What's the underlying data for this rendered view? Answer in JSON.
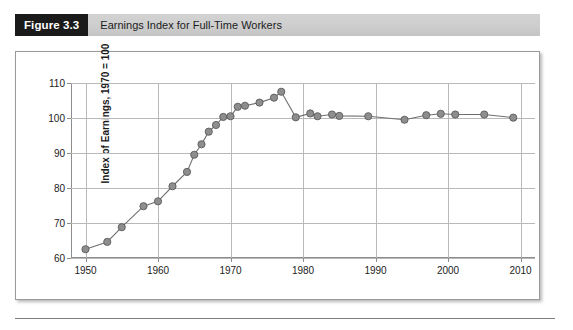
{
  "figure": {
    "number_label": "Figure 3.3",
    "caption": "Earnings Index for Full-Time Workers"
  },
  "style": {
    "marker_fill": "#8e8e8e",
    "marker_stroke": "#5a5a5a",
    "line_color": "#6f6f6f",
    "grid_color": "#b9b9b9",
    "axis_color": "#8d8d8d",
    "band_color": "#cccccc",
    "number_box_color": "#1a1a1a"
  },
  "chart_data": {
    "type": "line",
    "title": "Earnings Index for Full-Time Workers",
    "xlabel": "",
    "ylabel": "Index of Earnings, 1970 = 100",
    "xlim": [
      1948,
      2012
    ],
    "ylim": [
      60,
      110
    ],
    "xticks": [
      1950,
      1960,
      1970,
      1980,
      1990,
      2000,
      2010
    ],
    "yticks": [
      60,
      70,
      80,
      90,
      100,
      110
    ],
    "grid": true,
    "legend": null,
    "series": [
      {
        "name": "Index of Earnings",
        "x": [
          1950,
          1953,
          1955,
          1958,
          1960,
          1962,
          1964,
          1965,
          1966,
          1967,
          1968,
          1969,
          1970,
          1971,
          1972,
          1974,
          1976,
          1977,
          1979,
          1981,
          1982,
          1984,
          1985,
          1989,
          1994,
          1997,
          1999,
          2001,
          2005,
          2009
        ],
        "values": [
          62.5,
          64.6,
          68.8,
          74.8,
          76.2,
          80.5,
          84.6,
          89.5,
          92.5,
          96.1,
          98.0,
          100.3,
          100.5,
          103.2,
          103.5,
          104.4,
          105.8,
          107.5,
          100.2,
          101.3,
          100.5,
          101.0,
          100.6,
          100.5,
          99.5,
          100.8,
          101.2,
          101.0,
          101.0,
          100.1
        ]
      }
    ]
  },
  "y_tick_labels": [
    "110",
    "100",
    "90",
    "80",
    "70",
    "60"
  ],
  "x_tick_labels": [
    "1950",
    "1960",
    "1970",
    "1980",
    "1990",
    "2000",
    "2010"
  ]
}
